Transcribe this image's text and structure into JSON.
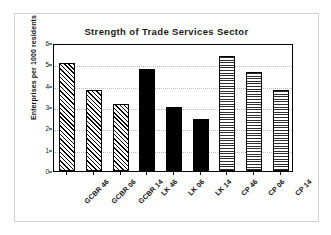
{
  "chart_data": {
    "type": "bar",
    "title": "Strength of Trade Services Sector",
    "xlabel": "",
    "ylabel": "Enterprises per 1000 residents",
    "categories": [
      "GCBR 46",
      "GCBR 06",
      "GCBR 14",
      "LK 46",
      "LK 06",
      "LK 14",
      "CP 46",
      "CP 06",
      "CP 14"
    ],
    "values": [
      5.05,
      3.82,
      3.12,
      4.78,
      3.02,
      2.45,
      5.37,
      4.62,
      3.78
    ],
    "ylim": [
      0,
      6
    ],
    "yticks": [
      "0",
      "1",
      "2",
      "3",
      "4",
      "5",
      "6"
    ],
    "ytick_values": [
      0,
      1,
      2,
      3,
      4,
      5,
      6
    ],
    "grid": true,
    "legend": "none",
    "groups": [
      {
        "name": "GCBR",
        "fill": "diagonal-hatch",
        "color": "#000000"
      },
      {
        "name": "LK",
        "fill": "solid",
        "color": "#000000"
      },
      {
        "name": "CP",
        "fill": "horizontal-hatch",
        "color": "#2e2e2e"
      }
    ],
    "bar_fills": [
      "diag",
      "diag",
      "diag",
      "solid",
      "solid",
      "solid",
      "horiz",
      "horiz",
      "horiz"
    ]
  },
  "colors": {
    "axis": "#000000",
    "gridline": "#b9b9b9",
    "frame_border": "#d2d2d2",
    "text": "#111111",
    "background": "#ffffff"
  }
}
